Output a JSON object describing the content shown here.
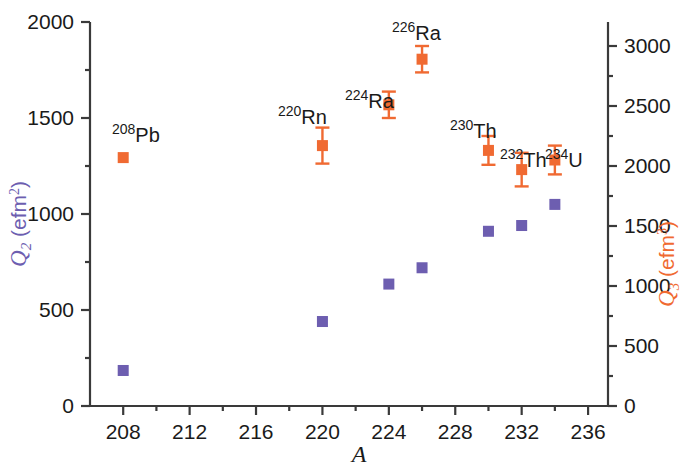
{
  "chart_data": {
    "type": "scatter",
    "title": "",
    "xlabel": "A",
    "xlim": [
      206,
      237.2
    ],
    "xticks": [
      208,
      212,
      216,
      220,
      224,
      228,
      232,
      236
    ],
    "xtick_labels": [
      "208",
      "212",
      "216",
      "220",
      "224",
      "228",
      "232",
      "236"
    ],
    "x_minor_ticks": [
      210,
      214,
      218,
      222,
      226,
      230,
      234
    ],
    "grid": false,
    "legend": "none",
    "axes": [
      {
        "id": "left",
        "label": "Q2 (efm2)",
        "label_symbol": "Q",
        "label_subscript": "2",
        "label_unit": "efm",
        "label_unit_superscript": "2",
        "color": "#6D5EB0",
        "ylim": [
          0,
          2000
        ],
        "yticks": [
          0,
          500,
          1000,
          1500,
          2000
        ],
        "ytick_labels": [
          "0",
          "500",
          "1000",
          "1500",
          "2000"
        ],
        "y_minor_ticks": [
          250,
          750,
          1250,
          1750
        ]
      },
      {
        "id": "right",
        "label": "Q3 (efm3)",
        "label_symbol": "Q",
        "label_subscript": "3",
        "label_unit": "efm",
        "label_unit_superscript": "3",
        "color": "#F06A32",
        "ylim": [
          0,
          3200
        ],
        "yticks": [
          0,
          500,
          1000,
          1500,
          2000,
          2500,
          3000
        ],
        "ytick_labels": [
          "0",
          "500",
          "1000",
          "1500",
          "2000",
          "2500",
          "3000"
        ],
        "y_minor_ticks": [
          250,
          750,
          1250,
          1750,
          2250,
          2750
        ]
      }
    ],
    "series": [
      {
        "name": "Q2",
        "axis": "left",
        "color": "#6D5EB0",
        "marker": "square",
        "x": [
          208,
          220,
          224,
          226,
          230,
          232,
          234
        ],
        "values": [
          185,
          440,
          635,
          720,
          910,
          940,
          1050
        ],
        "errors": [
          0,
          0,
          0,
          0,
          0,
          0,
          0
        ]
      },
      {
        "name": "Q3",
        "axis": "right",
        "color": "#F06A32",
        "marker": "square",
        "x": [
          208,
          220,
          224,
          226,
          230,
          232,
          234
        ],
        "values": [
          2070,
          2170,
          2510,
          2890,
          2130,
          1970,
          2050
        ],
        "errors": [
          0,
          150,
          110,
          110,
          120,
          140,
          120
        ]
      }
    ],
    "annotations": [
      {
        "text": "208Pb",
        "mass": "208",
        "element": "Pb",
        "x": 208,
        "label_x": 112,
        "label_y": 122
      },
      {
        "text": "220Rn",
        "mass": "220",
        "element": "Rn",
        "x": 220,
        "label_x": 278,
        "label_y": 104
      },
      {
        "text": "224Ra",
        "mass": "224",
        "element": "Ra",
        "x": 224,
        "label_x": 345,
        "label_y": 88
      },
      {
        "text": "226Ra",
        "mass": "226",
        "element": "Ra",
        "x": 226,
        "label_x": 392,
        "label_y": 20
      },
      {
        "text": "230Th",
        "mass": "230",
        "element": "Th",
        "x": 230,
        "label_x": 450,
        "label_y": 118
      },
      {
        "text": "232Th",
        "mass": "232",
        "element": "Th",
        "x": 232,
        "label_x": 500,
        "label_y": 147
      },
      {
        "text": "234U",
        "mass": "234",
        "element": "U",
        "x": 234,
        "label_x": 545,
        "label_y": 147
      }
    ]
  },
  "plot_area": {
    "left": 90,
    "right": 608,
    "top": 22,
    "bottom": 406
  }
}
